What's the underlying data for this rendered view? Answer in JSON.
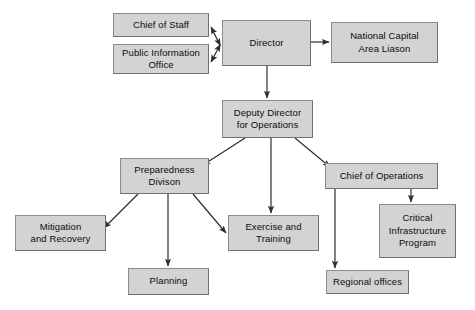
{
  "diagram": {
    "type": "organizational-chart",
    "title": "",
    "background_color": "#ffffff",
    "node_fill_color": "#d3d3d3",
    "node_border_color": "#8c8c8c",
    "edge_color": "#3a3a3a",
    "text_color": "#0b0b0b",
    "nodes": [
      {
        "id": "chief-of-staff",
        "label": "Chief of Staff",
        "x": 113,
        "y": 13,
        "w": 96,
        "h": 24,
        "level": "staff"
      },
      {
        "id": "public-information-office",
        "label": "Public Information\nOffice",
        "x": 113,
        "y": 44,
        "w": 96,
        "h": 30,
        "level": "staff"
      },
      {
        "id": "director",
        "label": "Director",
        "x": 222,
        "y": 20,
        "w": 89,
        "h": 46,
        "level": "executive"
      },
      {
        "id": "national-capital-area-liason",
        "label": "National Capital\nArea Liason",
        "x": 331,
        "y": 22,
        "w": 107,
        "h": 41,
        "level": "staff"
      },
      {
        "id": "deputy-director-for-operations",
        "label": "Deputy Director\nfor Operations",
        "x": 222,
        "y": 100,
        "w": 91,
        "h": 38,
        "level": "executive"
      },
      {
        "id": "preparedness-divison",
        "label": "Preparedness\nDivison",
        "x": 120,
        "y": 158,
        "w": 89,
        "h": 36,
        "level": "division"
      },
      {
        "id": "chief-of-operations",
        "label": "Chief of Operations",
        "x": 325,
        "y": 163,
        "w": 113,
        "h": 26,
        "level": "division"
      },
      {
        "id": "mitigation-and-recovery",
        "label": "Mitigation\nand Recovery",
        "x": 15,
        "y": 215,
        "w": 91,
        "h": 36,
        "level": "branch"
      },
      {
        "id": "exercise-and-training",
        "label": "Exercise and\nTraining",
        "x": 228,
        "y": 215,
        "w": 91,
        "h": 36,
        "level": "branch"
      },
      {
        "id": "critical-infrastructure-program",
        "label": "Critical\nInfrastructure\nProgram",
        "x": 379,
        "y": 204,
        "w": 77,
        "h": 54,
        "level": "branch"
      },
      {
        "id": "planning",
        "label": "Planning",
        "x": 128,
        "y": 268,
        "w": 81,
        "h": 27,
        "level": "branch"
      },
      {
        "id": "regional-offices",
        "label": "Regional offices",
        "x": 326,
        "y": 270,
        "w": 83,
        "h": 24,
        "level": "branch"
      }
    ],
    "edges": [
      {
        "id": "director-to-chief-of-staff",
        "from": "director",
        "to": "chief-of-staff",
        "style": "bidirectional"
      },
      {
        "id": "director-to-public-information-office",
        "from": "director",
        "to": "public-information-office",
        "style": "bidirectional"
      },
      {
        "id": "director-to-national-capital-area-liason",
        "from": "director",
        "to": "national-capital-area-liason",
        "style": "directed"
      },
      {
        "id": "director-to-deputy-director",
        "from": "director",
        "to": "deputy-director-for-operations",
        "style": "directed"
      },
      {
        "id": "deputy-to-preparedness",
        "from": "deputy-director-for-operations",
        "to": "preparedness-divison",
        "style": "directed"
      },
      {
        "id": "deputy-to-exercise-and-training",
        "from": "deputy-director-for-operations",
        "to": "exercise-and-training",
        "style": "directed"
      },
      {
        "id": "deputy-to-chief-of-operations",
        "from": "deputy-director-for-operations",
        "to": "chief-of-operations",
        "style": "directed"
      },
      {
        "id": "preparedness-to-mitigation",
        "from": "preparedness-divison",
        "to": "mitigation-and-recovery",
        "style": "directed"
      },
      {
        "id": "preparedness-to-planning",
        "from": "preparedness-divison",
        "to": "planning",
        "style": "directed"
      },
      {
        "id": "preparedness-to-exercise",
        "from": "preparedness-divison",
        "to": "exercise-and-training",
        "style": "directed"
      },
      {
        "id": "chief-of-operations-to-critical-infrastructure",
        "from": "chief-of-operations",
        "to": "critical-infrastructure-program",
        "style": "directed"
      },
      {
        "id": "chief-of-operations-to-regional-offices",
        "from": "chief-of-operations",
        "to": "regional-offices",
        "style": "directed"
      }
    ]
  }
}
